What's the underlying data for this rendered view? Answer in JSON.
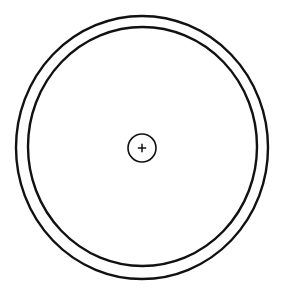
{
  "diagram": {
    "background": "#ffffff",
    "stroke_color": "#111111",
    "outer_ring": {
      "cx": 142,
      "cy": 147.5,
      "rx": 126,
      "ry": 131.5,
      "stroke_width": 2.4
    },
    "inner_ring": {
      "cx": 142.5,
      "cy": 146.5,
      "rx": 114.5,
      "ry": 119.5,
      "stroke_width": 2.4
    },
    "center_marker": {
      "cx": 142,
      "cy": 148,
      "r": 14,
      "stroke_width": 1.6,
      "symbol": "+"
    }
  }
}
